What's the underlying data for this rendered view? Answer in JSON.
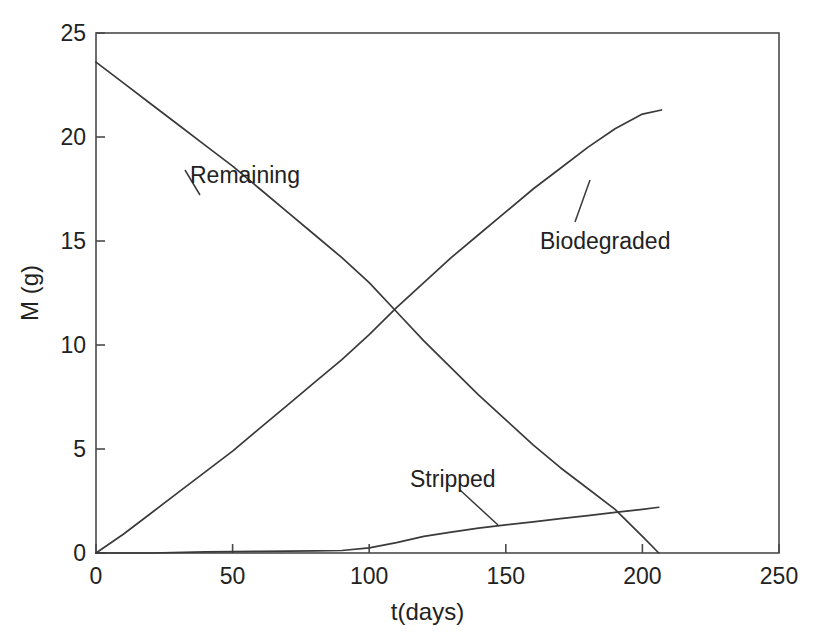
{
  "chart_data": {
    "type": "line",
    "title": "",
    "xlabel": "t(days)",
    "ylabel": "M (g)",
    "xlim": [
      0,
      250
    ],
    "ylim": [
      0,
      25
    ],
    "xticks": [
      0,
      50,
      100,
      150,
      200,
      250
    ],
    "yticks": [
      0,
      5,
      10,
      15,
      20,
      25
    ],
    "xtick_labels": [
      "0",
      "50",
      "100",
      "150",
      "200",
      "250"
    ],
    "ytick_labels": [
      "0",
      "5",
      "10",
      "15",
      "20",
      "25"
    ],
    "grid": false,
    "legend_position": "inline-annotations",
    "line_color": "#3a3a3a",
    "axis_color": "#4a4a4a",
    "series": [
      {
        "name": "Remaining",
        "label_position": {
          "x": 190,
          "y": 162
        },
        "leader_line": {
          "x1": 185,
          "y1": 170,
          "x2": 200,
          "y2": 195
        },
        "x": [
          0,
          10,
          20,
          30,
          40,
          50,
          60,
          70,
          80,
          90,
          100,
          110,
          120,
          130,
          140,
          150,
          160,
          170,
          180,
          190,
          200,
          206
        ],
        "y": [
          23.6,
          22.6,
          21.6,
          20.6,
          19.6,
          18.6,
          17.5,
          16.4,
          15.3,
          14.2,
          13.0,
          11.6,
          10.2,
          8.9,
          7.6,
          6.4,
          5.2,
          4.1,
          3.1,
          2.1,
          0.8,
          0.0
        ]
      },
      {
        "name": "Biodegraded",
        "label_position": {
          "x": 540,
          "y": 228
        },
        "leader_line": {
          "x1": 575,
          "y1": 222,
          "x2": 590,
          "y2": 180
        },
        "x": [
          0,
          10,
          20,
          30,
          40,
          50,
          60,
          70,
          80,
          90,
          100,
          110,
          120,
          130,
          140,
          150,
          160,
          170,
          180,
          190,
          200,
          207
        ],
        "y": [
          0.0,
          0.9,
          1.9,
          2.9,
          3.9,
          4.9,
          6.0,
          7.1,
          8.2,
          9.3,
          10.5,
          11.8,
          13.0,
          14.2,
          15.3,
          16.4,
          17.5,
          18.5,
          19.5,
          20.4,
          21.1,
          21.3
        ]
      },
      {
        "name": "Stripped",
        "label_position": {
          "x": 410,
          "y": 466
        },
        "leader_line": {
          "x1": 460,
          "y1": 490,
          "x2": 498,
          "y2": 525
        },
        "x": [
          0,
          20,
          40,
          50,
          60,
          70,
          80,
          90,
          100,
          110,
          120,
          130,
          140,
          150,
          160,
          170,
          180,
          190,
          200,
          206
        ],
        "y": [
          0.0,
          0.0,
          0.05,
          0.07,
          0.08,
          0.09,
          0.1,
          0.12,
          0.25,
          0.5,
          0.8,
          1.0,
          1.2,
          1.35,
          1.5,
          1.65,
          1.8,
          1.95,
          2.1,
          2.2
        ]
      }
    ]
  },
  "axes": {
    "x_title": "t(days)",
    "y_title": "M (g)"
  }
}
